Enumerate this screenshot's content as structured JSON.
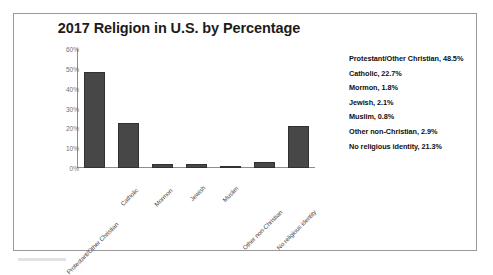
{
  "frame": {
    "border_color": "#9a9a9a",
    "background": "#ffffff"
  },
  "chart_data": {
    "type": "bar",
    "title": "2017 Religion in U.S. by Percentage",
    "xlabel": "",
    "ylabel": "",
    "categories": [
      "Protestant/Other Christian",
      "Catholic",
      "Mormon",
      "Jewish",
      "Muslim",
      "Other non-Christian",
      "No religious identity"
    ],
    "values": [
      48.5,
      22.7,
      1.8,
      2.1,
      0.8,
      2.9,
      21.3
    ],
    "ylim": [
      0,
      60
    ],
    "yticks": [
      0,
      10,
      20,
      30,
      40,
      50,
      60
    ],
    "ytick_labels": [
      "0%",
      "10%",
      "20%",
      "30%",
      "40%",
      "50%",
      "60%"
    ],
    "grid": false,
    "legend_position": "right",
    "legend_entries": [
      "Protestant/Other Christian, 48.5%",
      "Catholic, 22.7%",
      "Mormon, 1.8%",
      "Jewish, 2.1%",
      "Muslim, 0.8%",
      "Other non-Christian, 2.9%",
      "No religious identity, 21.3%"
    ],
    "bar_color": "#474747",
    "bar_edge_color": "#313131",
    "axis_color": "#8d8d8d"
  }
}
